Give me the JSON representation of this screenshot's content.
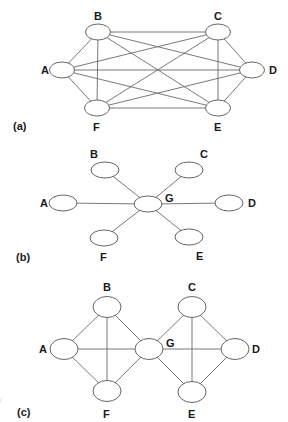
{
  "figure": {
    "panels": [
      {
        "id": "a",
        "label": "(a)",
        "label_pos": [
          13,
          130
        ],
        "topology": "full-mesh",
        "node_rx": 12.5,
        "node_ry": 8,
        "nodes": [
          {
            "id": "A",
            "label": "A",
            "cx": 62,
            "cy": 70,
            "lx": 41,
            "ly": 74
          },
          {
            "id": "B",
            "label": "B",
            "cx": 98,
            "cy": 32,
            "lx": 94,
            "ly": 20
          },
          {
            "id": "C",
            "label": "C",
            "cx": 218,
            "cy": 32,
            "lx": 214,
            "ly": 20
          },
          {
            "id": "D",
            "label": "D",
            "cx": 252,
            "cy": 70,
            "lx": 269,
            "ly": 74
          },
          {
            "id": "E",
            "label": "E",
            "cx": 218,
            "cy": 108,
            "lx": 214,
            "ly": 131
          },
          {
            "id": "F",
            "label": "F",
            "cx": 97,
            "cy": 108,
            "lx": 93,
            "ly": 131
          }
        ],
        "edges": [
          [
            "A",
            "B"
          ],
          [
            "A",
            "C"
          ],
          [
            "A",
            "D"
          ],
          [
            "A",
            "E"
          ],
          [
            "A",
            "F"
          ],
          [
            "B",
            "C"
          ],
          [
            "B",
            "D"
          ],
          [
            "B",
            "E"
          ],
          [
            "B",
            "F"
          ],
          [
            "C",
            "D"
          ],
          [
            "C",
            "E"
          ],
          [
            "C",
            "F"
          ],
          [
            "D",
            "E"
          ],
          [
            "D",
            "F"
          ],
          [
            "E",
            "F"
          ]
        ]
      },
      {
        "id": "b",
        "label": "(b)",
        "label_pos": [
          16,
          261
        ],
        "topology": "star",
        "node_rx": 14,
        "node_ry": 8,
        "nodes": [
          {
            "id": "A",
            "label": "A",
            "cx": 63,
            "cy": 203,
            "lx": 40,
            "ly": 207
          },
          {
            "id": "B",
            "label": "B",
            "cx": 105,
            "cy": 170,
            "lx": 90,
            "ly": 158
          },
          {
            "id": "C",
            "label": "C",
            "cx": 189,
            "cy": 170,
            "lx": 200,
            "ly": 158
          },
          {
            "id": "D",
            "label": "D",
            "cx": 229,
            "cy": 203,
            "lx": 248,
            "ly": 207
          },
          {
            "id": "E",
            "label": "E",
            "cx": 189,
            "cy": 237,
            "lx": 196,
            "ly": 260
          },
          {
            "id": "F",
            "label": "F",
            "cx": 104,
            "cy": 238,
            "lx": 100,
            "ly": 261
          },
          {
            "id": "G",
            "label": "G",
            "cx": 148,
            "cy": 204,
            "lx": 165,
            "ly": 202
          }
        ],
        "edges": [
          [
            "G",
            "A"
          ],
          [
            "G",
            "B"
          ],
          [
            "G",
            "C"
          ],
          [
            "G",
            "D"
          ],
          [
            "G",
            "E"
          ],
          [
            "G",
            "F"
          ]
        ]
      },
      {
        "id": "c",
        "label": "(c)",
        "label_pos": [
          17,
          416
        ],
        "topology": "two-clusters-shared-node",
        "node_rx": 14,
        "node_ry": 10.5,
        "nodes": [
          {
            "id": "A",
            "label": "A",
            "cx": 64,
            "cy": 349,
            "lx": 39,
            "ly": 353
          },
          {
            "id": "B",
            "label": "B",
            "cx": 107,
            "cy": 307,
            "lx": 103,
            "ly": 291
          },
          {
            "id": "C",
            "label": "C",
            "cx": 192,
            "cy": 307,
            "lx": 188,
            "ly": 291
          },
          {
            "id": "D",
            "label": "D",
            "cx": 235,
            "cy": 349,
            "lx": 252,
            "ly": 353
          },
          {
            "id": "E",
            "label": "E",
            "cx": 192,
            "cy": 392,
            "lx": 188,
            "ly": 418
          },
          {
            "id": "F",
            "label": "F",
            "cx": 107,
            "cy": 391,
            "lx": 103,
            "ly": 418
          },
          {
            "id": "G",
            "label": "G",
            "cx": 149,
            "cy": 349,
            "lx": 166,
            "ly": 347
          }
        ],
        "edges": [
          [
            "A",
            "B"
          ],
          [
            "A",
            "F"
          ],
          [
            "A",
            "G"
          ],
          [
            "B",
            "F"
          ],
          [
            "B",
            "G"
          ],
          [
            "F",
            "G"
          ],
          [
            "G",
            "C"
          ],
          [
            "G",
            "E"
          ],
          [
            "G",
            "D"
          ],
          [
            "C",
            "E"
          ],
          [
            "C",
            "D"
          ],
          [
            "E",
            "D"
          ]
        ]
      }
    ]
  }
}
